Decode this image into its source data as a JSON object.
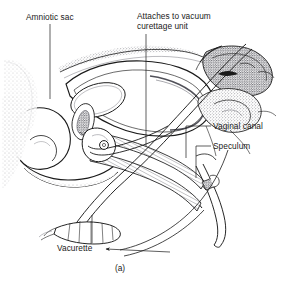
{
  "figure": {
    "caption": "(a)",
    "type": "medical-illustration",
    "background_color": "#ffffff",
    "ink_color": "#1a1a1a",
    "stipple_color": "#55555f"
  },
  "labels": [
    {
      "id": "amniotic_sac",
      "text": "Amniotic sac",
      "lines": [
        "Amniotic sac"
      ]
    },
    {
      "id": "attaches_vacuum",
      "text": "Attaches to vacuum curettage unit",
      "lines": [
        "Attaches to vacuum",
        "curettage unit"
      ]
    },
    {
      "id": "vaginal_canal",
      "text": "Vaginal canal",
      "lines": [
        "Vaginal canal"
      ]
    },
    {
      "id": "speculum",
      "text": "Speculum",
      "lines": [
        "Speculum"
      ]
    },
    {
      "id": "vacurette",
      "text": "Vacurette",
      "lines": [
        "Vacurette"
      ]
    }
  ],
  "label_text": {
    "amniotic_sac": "Amniotic sac",
    "attaches_vacuum_l1": "Attaches to vacuum",
    "attaches_vacuum_l2": "curettage unit",
    "vaginal_canal": "Vaginal canal",
    "speculum": "Speculum",
    "vacurette": "Vacurette",
    "caption": "(a)"
  }
}
